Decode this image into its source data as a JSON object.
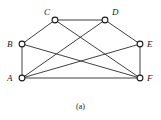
{
  "figure": {
    "caption": "(a)",
    "caption_x": 0,
    "caption_y": 102,
    "background_color": "#ffffff",
    "edge_color": "#2b2b2b",
    "vertex_fill_color": "#ffffff",
    "vertex_stroke_color": "#1d1d1d",
    "label_color": "#1a1a1a"
  },
  "graph": {
    "type": "undirected-graph",
    "vertex_count": 6,
    "edge_count": 10,
    "vertices": [
      {
        "id": "A",
        "label": "A",
        "cx": 22,
        "cy": 78,
        "r": 2.9,
        "label_x": 7,
        "label_y": 74
      },
      {
        "id": "B",
        "label": "B",
        "cx": 22,
        "cy": 44,
        "r": 2.9,
        "label_x": 7,
        "label_y": 40
      },
      {
        "id": "C",
        "label": "C",
        "cx": 55,
        "cy": 20,
        "r": 2.9,
        "label_x": 44,
        "label_y": 8
      },
      {
        "id": "D",
        "label": "D",
        "cx": 105,
        "cy": 20,
        "r": 2.9,
        "label_x": 112,
        "label_y": 8
      },
      {
        "id": "E",
        "label": "E",
        "cx": 140,
        "cy": 44,
        "r": 2.9,
        "label_x": 147,
        "label_y": 40
      },
      {
        "id": "F",
        "label": "F",
        "cx": 140,
        "cy": 78,
        "r": 2.9,
        "label_x": 147,
        "label_y": 74
      }
    ],
    "edges": [
      {
        "from": "A",
        "to": "B",
        "x1": 22,
        "y1": 78,
        "x2": 22,
        "y2": 44
      },
      {
        "from": "B",
        "to": "C",
        "x1": 22,
        "y1": 44,
        "x2": 55,
        "y2": 20
      },
      {
        "from": "C",
        "to": "D",
        "x1": 55,
        "y1": 20,
        "x2": 105,
        "y2": 20
      },
      {
        "from": "D",
        "to": "E",
        "x1": 105,
        "y1": 20,
        "x2": 140,
        "y2": 44
      },
      {
        "from": "E",
        "to": "F",
        "x1": 140,
        "y1": 44,
        "x2": 140,
        "y2": 78
      },
      {
        "from": "A",
        "to": "F",
        "x1": 22,
        "y1": 78,
        "x2": 140,
        "y2": 78
      },
      {
        "from": "A",
        "to": "D",
        "x1": 22,
        "y1": 78,
        "x2": 105,
        "y2": 20
      },
      {
        "from": "A",
        "to": "E",
        "x1": 22,
        "y1": 78,
        "x2": 140,
        "y2": 44
      },
      {
        "from": "C",
        "to": "F",
        "x1": 55,
        "y1": 20,
        "x2": 140,
        "y2": 78
      },
      {
        "from": "B",
        "to": "F",
        "x1": 22,
        "y1": 44,
        "x2": 140,
        "y2": 78
      }
    ]
  }
}
